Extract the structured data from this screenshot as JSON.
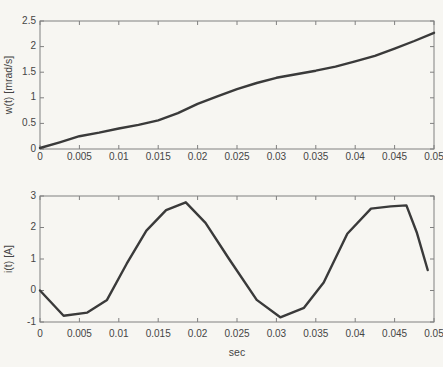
{
  "figure": {
    "background": "#f7f6f2",
    "axis_color": "#808080",
    "tick_label_color": "#454545",
    "line_color": "#3a3a3a"
  },
  "chart_data": [
    {
      "type": "line",
      "title": "",
      "xlabel": "",
      "ylabel": "w(t) [mrad/s]",
      "xlim": [
        0,
        0.05
      ],
      "ylim": [
        0,
        2.5
      ],
      "xticks": [
        0,
        0.005,
        0.01,
        0.015,
        0.02,
        0.025,
        0.03,
        0.035,
        0.04,
        0.045,
        0.05
      ],
      "xtick_labels": [
        "0",
        "0.005",
        "0.01",
        "0.015",
        "0.02",
        "0.025",
        "0.03",
        "0.035",
        "0.04",
        "0.045",
        "0.05"
      ],
      "yticks": [
        0,
        0.5,
        1,
        1.5,
        2,
        2.5
      ],
      "ytick_labels": [
        "0",
        "0.5",
        "1",
        "1.5",
        "2",
        "2.5"
      ],
      "grid": false,
      "legend": "none",
      "line_color": "#3a3a3a",
      "series": [
        {
          "name": "w(t)",
          "x": [
            0.0,
            0.0025,
            0.005,
            0.0075,
            0.01,
            0.0125,
            0.015,
            0.0175,
            0.02,
            0.0225,
            0.025,
            0.0275,
            0.03,
            0.0325,
            0.035,
            0.0375,
            0.04,
            0.0425,
            0.045,
            0.0475,
            0.05
          ],
          "y": [
            0.02,
            0.13,
            0.25,
            0.32,
            0.4,
            0.47,
            0.56,
            0.7,
            0.88,
            1.03,
            1.17,
            1.29,
            1.39,
            1.46,
            1.53,
            1.61,
            1.71,
            1.82,
            1.96,
            2.11,
            2.27
          ]
        }
      ]
    },
    {
      "type": "line",
      "title": "",
      "xlabel": "sec",
      "ylabel": "i(t) [A]",
      "xlim": [
        0,
        0.05
      ],
      "ylim": [
        -1,
        3
      ],
      "xticks": [
        0,
        0.005,
        0.01,
        0.015,
        0.02,
        0.025,
        0.03,
        0.035,
        0.04,
        0.045,
        0.05
      ],
      "xtick_labels": [
        "0",
        "0.005",
        "0.01",
        "0.015",
        "0.02",
        "0.025",
        "0.03",
        "0.035",
        "0.04",
        "0.045",
        "0.05"
      ],
      "yticks": [
        -1,
        0,
        1,
        2,
        3
      ],
      "ytick_labels": [
        "-1",
        "0",
        "1",
        "2",
        "3"
      ],
      "grid": false,
      "legend": "none",
      "line_color": "#3a3a3a",
      "series": [
        {
          "name": "i(t)",
          "x": [
            0.0,
            0.003,
            0.006,
            0.0085,
            0.011,
            0.0135,
            0.016,
            0.0185,
            0.021,
            0.024,
            0.0275,
            0.0305,
            0.0335,
            0.036,
            0.039,
            0.042,
            0.0445,
            0.0465,
            0.0478,
            0.0492
          ],
          "y": [
            0.0,
            -0.8,
            -0.7,
            -0.3,
            0.85,
            1.9,
            2.55,
            2.8,
            2.15,
            1.0,
            -0.3,
            -0.85,
            -0.55,
            0.25,
            1.8,
            2.6,
            2.67,
            2.7,
            1.85,
            0.65
          ]
        }
      ]
    }
  ]
}
